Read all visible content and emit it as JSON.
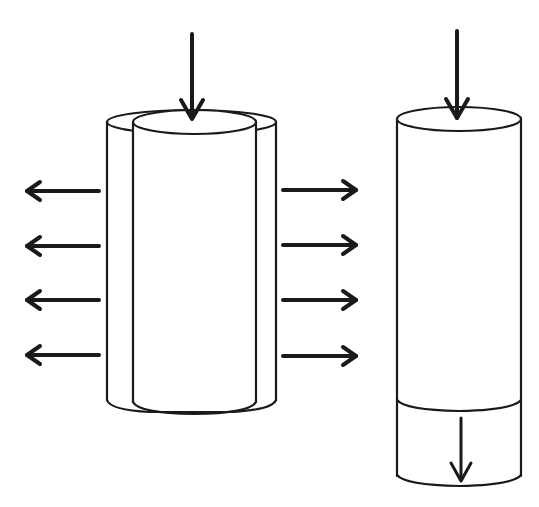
{
  "diagram": {
    "type": "schematic",
    "colors": {
      "background": "#ffffff",
      "line": "#1a1a1a"
    },
    "left_figure": {
      "label": "",
      "top_arrow": {
        "direction": "down",
        "x": 192,
        "y1": 33,
        "y2": 120
      },
      "outer_cylinder": {
        "x1": 107,
        "x2": 276,
        "top_y": 122,
        "bottom_y": 412
      },
      "inner_cylinder": {
        "x1": 133,
        "x2": 256,
        "top_y": 122,
        "bottom_y": 413
      },
      "left_arrows": [
        {
          "direction": "left",
          "y": 191
        },
        {
          "direction": "left",
          "y": 246
        },
        {
          "direction": "left",
          "y": 300
        },
        {
          "direction": "left",
          "y": 355
        }
      ],
      "right_arrows": [
        {
          "direction": "right",
          "y": 190
        },
        {
          "direction": "right",
          "y": 245
        },
        {
          "direction": "right",
          "y": 300
        },
        {
          "direction": "right",
          "y": 356
        }
      ]
    },
    "right_figure": {
      "label": "",
      "top_arrow": {
        "direction": "down",
        "x": 457,
        "y1": 30,
        "y2": 119
      },
      "cylinder": {
        "x1": 397,
        "x2": 521,
        "top_y": 119,
        "bottom_y": 485
      },
      "divider_y": 403,
      "bottom_arrow": {
        "direction": "down",
        "x": 461,
        "y1": 417,
        "y2": 482
      }
    }
  }
}
